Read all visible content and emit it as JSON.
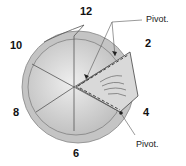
{
  "diagram": {
    "numbers": {
      "n12": "12",
      "n2": "2",
      "n4": "4",
      "n6": "6",
      "n8": "8",
      "n10": "10"
    },
    "pivot_top": "Pivot.",
    "pivot_bottom": "Pivot."
  }
}
